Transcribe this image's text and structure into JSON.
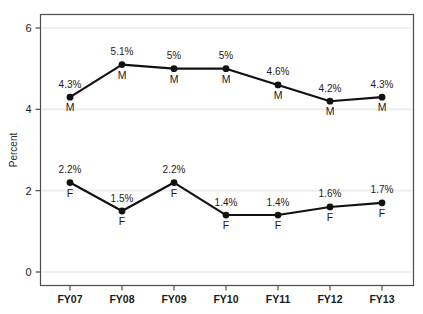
{
  "chart_data": {
    "type": "line",
    "title": "",
    "xlabel": "",
    "ylabel": "Percent",
    "categories": [
      "FY07",
      "FY08",
      "FY09",
      "FY10",
      "FY11",
      "FY12",
      "FY13"
    ],
    "ylim": [
      0,
      6.4
    ],
    "yticks": [
      0,
      2,
      4,
      6
    ],
    "ytick_labels": [
      "0",
      "2",
      "4",
      "6"
    ],
    "grid": true,
    "legend": "none",
    "series": [
      {
        "name": "M",
        "marker_letter": "M",
        "values": [
          4.3,
          5.1,
          5.0,
          5.0,
          4.6,
          4.2,
          4.3
        ],
        "data_labels": [
          "4.3%",
          "5.1%",
          "5%",
          "5%",
          "4.6%",
          "4.2%",
          "4.3%"
        ],
        "color": "#111111"
      },
      {
        "name": "F",
        "marker_letter": "F",
        "values": [
          2.2,
          1.5,
          2.2,
          1.4,
          1.4,
          1.6,
          1.7
        ],
        "data_labels": [
          "2.2%",
          "1.5%",
          "2.2%",
          "1.4%",
          "1.4%",
          "1.6%",
          "1.7%"
        ],
        "color": "#111111"
      }
    ],
    "colors": {
      "line": "#111111",
      "marker": "#111111",
      "grid": "#ebebeb",
      "axis": "#4d4d4d",
      "text": "#1a1a1a",
      "background": "#ffffff"
    }
  }
}
